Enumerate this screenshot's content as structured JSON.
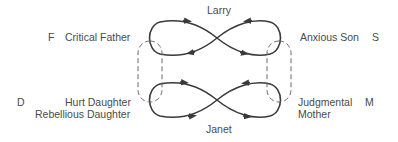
{
  "top_label": "Larry",
  "bottom_label": "Janet",
  "left_top": {
    "letter": "F",
    "role": "Critical Father"
  },
  "right_top": {
    "role": "Anxious Son",
    "letter": "S"
  },
  "left_bottom": {
    "letter": "D",
    "role_line1": "Hurt Daughter",
    "role_line2": "Rebellious Daughter"
  },
  "right_bottom": {
    "role_line1": "Judgmental",
    "role_line2": "Mother",
    "letter": "M"
  },
  "colors": {
    "line": "#3a3a3a",
    "dashed": "#6a6a6a",
    "text": "#4a4a4a"
  }
}
